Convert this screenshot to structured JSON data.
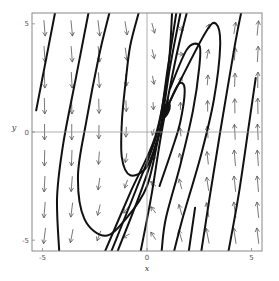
{
  "chart_data": {
    "type": "vector_field_phase_portrait",
    "title": "",
    "xlabel": "x",
    "ylabel": "y",
    "xlim": [
      -5.5,
      5.5
    ],
    "ylim": [
      -5.5,
      5.5
    ],
    "xticks": [
      -5,
      0,
      5
    ],
    "yticks": [
      -5,
      0,
      5
    ],
    "xtick_labels": [
      "-5",
      "0",
      "5"
    ],
    "ytick_labels": [
      "-5",
      "0",
      "5"
    ],
    "grid": false,
    "zero_lines": true,
    "legend": null,
    "equilibrium": {
      "x": 0.9,
      "y": 1.0,
      "type": "spiral"
    },
    "arrow_grid": {
      "x": [
        -4.9,
        -3.6,
        -2.3,
        -1.0,
        0.3,
        1.6,
        2.9,
        4.2,
        5.3
      ],
      "y": [
        4.8,
        3.6,
        2.4,
        1.2,
        0.0,
        -1.2,
        -2.4,
        -3.6,
        -4.8
      ]
    },
    "trajectories": [
      {
        "name": "traj-1",
        "points": [
          [
            -5.3,
            1.0
          ],
          [
            -4.9,
            3.0
          ],
          [
            -4.4,
            5.5
          ]
        ]
      },
      {
        "name": "traj-2",
        "points": [
          [
            -4.2,
            -5.5
          ],
          [
            -4.3,
            -3.0
          ],
          [
            -4.0,
            -0.5
          ],
          [
            -3.4,
            2.5
          ],
          [
            -2.8,
            5.5
          ]
        ]
      },
      {
        "name": "traj-3",
        "points": [
          [
            -1.8,
            5.5
          ],
          [
            -2.3,
            3.5
          ],
          [
            -2.9,
            0.5
          ],
          [
            -3.3,
            -2.0
          ],
          [
            -3.0,
            -4.0
          ],
          [
            -2.0,
            -4.8
          ],
          [
            -1.0,
            -4.0
          ],
          [
            0.0,
            -2.5
          ],
          [
            0.6,
            0.0
          ],
          [
            1.0,
            1.5
          ]
        ]
      },
      {
        "name": "traj-4",
        "points": [
          [
            -0.4,
            5.5
          ],
          [
            -0.8,
            4.0
          ],
          [
            -1.0,
            2.5
          ],
          [
            -1.2,
            0.5
          ],
          [
            -1.2,
            -1.2
          ],
          [
            -0.8,
            -2.0
          ],
          [
            0.0,
            -1.6
          ],
          [
            0.6,
            0.0
          ],
          [
            0.9,
            1.0
          ]
        ]
      },
      {
        "name": "traj-5",
        "points": [
          [
            -0.3,
            -5.5
          ],
          [
            0.2,
            -3.0
          ],
          [
            0.7,
            0.0
          ],
          [
            1.4,
            3.5
          ],
          [
            1.9,
            5.5
          ]
        ]
      },
      {
        "name": "traj-6",
        "points": [
          [
            -1.4,
            -5.5
          ],
          [
            -0.2,
            -2.5
          ],
          [
            0.6,
            0.0
          ],
          [
            1.1,
            3.0
          ],
          [
            1.6,
            5.5
          ]
        ]
      },
      {
        "name": "traj-7",
        "points": [
          [
            -1.7,
            -5.5
          ],
          [
            -0.5,
            -2.6
          ],
          [
            0.5,
            0.0
          ],
          [
            1.0,
            3.0
          ],
          [
            1.4,
            5.5
          ]
        ]
      },
      {
        "name": "traj-8",
        "points": [
          [
            -2.0,
            -5.5
          ],
          [
            -0.8,
            -2.8
          ],
          [
            0.4,
            -0.2
          ],
          [
            1.0,
            2.8
          ],
          [
            1.2,
            5.5
          ]
        ]
      },
      {
        "name": "traj-9",
        "points": [
          [
            0.9,
            1.0
          ],
          [
            1.5,
            2.2
          ],
          [
            2.8,
            4.6
          ],
          [
            3.3,
            5.0
          ],
          [
            3.5,
            4.0
          ],
          [
            3.2,
            1.5
          ],
          [
            2.6,
            -1.0
          ],
          [
            1.7,
            -4.0
          ],
          [
            1.3,
            -5.5
          ]
        ]
      },
      {
        "name": "traj-10",
        "points": [
          [
            1.1,
            2.0
          ],
          [
            1.9,
            3.8
          ],
          [
            2.5,
            4.0
          ],
          [
            2.5,
            3.0
          ],
          [
            2.2,
            1.0
          ],
          [
            1.6,
            -1.5
          ],
          [
            0.9,
            -4.0
          ],
          [
            0.7,
            -5.5
          ]
        ]
      },
      {
        "name": "traj-11",
        "points": [
          [
            1.0,
            1.2
          ],
          [
            1.5,
            2.2
          ],
          [
            1.8,
            2.0
          ],
          [
            1.6,
            0.5
          ],
          [
            1.2,
            -0.8
          ],
          [
            0.6,
            -2.5
          ]
        ]
      },
      {
        "name": "traj-12",
        "points": [
          [
            2.6,
            -5.5
          ],
          [
            3.0,
            -3.0
          ],
          [
            3.5,
            0.0
          ],
          [
            4.2,
            4.0
          ],
          [
            4.5,
            5.5
          ]
        ]
      },
      {
        "name": "traj-13",
        "points": [
          [
            3.9,
            -5.5
          ],
          [
            4.4,
            -2.8
          ],
          [
            4.9,
            0.5
          ],
          [
            5.2,
            2.5
          ]
        ]
      },
      {
        "name": "traj-14",
        "points": [
          [
            2.0,
            -5.5
          ],
          [
            2.3,
            -3.5
          ]
        ]
      }
    ]
  }
}
